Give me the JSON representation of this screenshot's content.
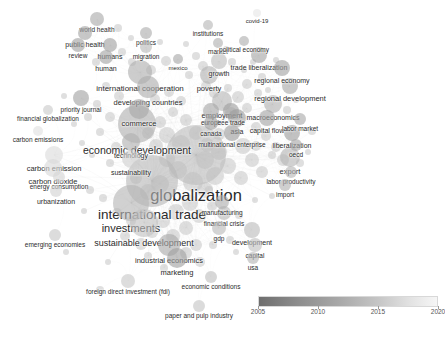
{
  "view": {
    "type": "bibliometric-network-map",
    "background": "#ffffff",
    "width": 445,
    "height": 337
  },
  "legend": {
    "name": "overlay-year-colorbar",
    "ticks": [
      "2005",
      "2010",
      "2015",
      "2020"
    ],
    "tick_positions": [
      0.0,
      0.333,
      0.666,
      1.0
    ],
    "gradient_from": "#6e6e6e",
    "gradient_to": "#f6f6f6"
  },
  "chart_data": {
    "type": "scatter",
    "title": "",
    "xlabel": "",
    "ylabel": "",
    "colorbar": {
      "label": "",
      "min": 2005,
      "max": 2020,
      "ticks": [
        2005,
        2010,
        2015,
        2020
      ]
    },
    "nodes": [
      {
        "label": "globalization",
        "x": 196,
        "y": 155,
        "size": 30,
        "fontsize": 16.5,
        "shade": "#bdbdbd",
        "year": 2013
      },
      {
        "label": "international trade",
        "x": 152,
        "y": 181,
        "size": 26,
        "fontsize": 13.5,
        "shade": "#b8b8b8",
        "year": 2012
      },
      {
        "label": "economic development",
        "x": 137,
        "y": 124,
        "size": 19,
        "fontsize": 10.5,
        "shade": "#b0b0b0",
        "year": 2011
      },
      {
        "label": "investments",
        "x": 131,
        "y": 203,
        "size": 18,
        "fontsize": 11.0,
        "shade": "#b4b4b4",
        "year": 2012
      },
      {
        "label": "sustainable development",
        "x": 144,
        "y": 223,
        "size": 14,
        "fontsize": 9.0,
        "shade": "#c2c2c2",
        "year": 2016
      },
      {
        "label": "international cooperation",
        "x": 140,
        "y": 72,
        "size": 12,
        "fontsize": 8.0,
        "shade": "#aeaeae",
        "year": 2010
      },
      {
        "label": "developing countries",
        "x": 148,
        "y": 87,
        "size": 11,
        "fontsize": 7.5,
        "shade": "#acacac",
        "year": 2010
      },
      {
        "label": "industrial economics",
        "x": 169,
        "y": 245,
        "size": 11,
        "fontsize": 7.5,
        "shade": "#a9a9a9",
        "year": 2009
      },
      {
        "label": "employment",
        "x": 222,
        "y": 101,
        "size": 10,
        "fontsize": 7.5,
        "shade": "#b6b6b6",
        "year": 2012
      },
      {
        "label": "commerce",
        "x": 139,
        "y": 109,
        "size": 10,
        "fontsize": 7.5,
        "shade": "#a8a8a8",
        "year": 2009
      },
      {
        "label": "export",
        "x": 290,
        "y": 157,
        "size": 10,
        "fontsize": 7.5,
        "shade": "#b5b5b5",
        "year": 2012
      },
      {
        "label": "marketing",
        "x": 177,
        "y": 258,
        "size": 10,
        "fontsize": 7.5,
        "shade": "#9f9f9f",
        "year": 2008
      },
      {
        "label": "asia",
        "x": 237,
        "y": 118,
        "size": 9,
        "fontsize": 7.0,
        "shade": "#9b9b9b",
        "year": 2008
      },
      {
        "label": "macroeconomics",
        "x": 273,
        "y": 104,
        "size": 9,
        "fontsize": 7.0,
        "shade": "#b2b2b2",
        "year": 2011
      },
      {
        "label": "carbon emission",
        "x": 54,
        "y": 155,
        "size": 9,
        "fontsize": 7.5,
        "shade": "#dcdcdc",
        "year": 2019
      },
      {
        "label": "carbon dioxide",
        "x": 53,
        "y": 168,
        "size": 9,
        "fontsize": 7.5,
        "shade": "#d8d8d8",
        "year": 2019
      },
      {
        "label": "technology",
        "x": 131,
        "y": 142,
        "size": 9,
        "fontsize": 7.0,
        "shade": "#b0b0b0",
        "year": 2011
      },
      {
        "label": "sustainability",
        "x": 131,
        "y": 159,
        "size": 9,
        "fontsize": 7.0,
        "shade": "#cfcfcf",
        "year": 2018
      },
      {
        "label": "poverty",
        "x": 209,
        "y": 75,
        "size": 9,
        "fontsize": 7.5,
        "shade": "#b2b2b2",
        "year": 2011
      },
      {
        "label": "growth",
        "x": 219,
        "y": 61,
        "size": 8,
        "fontsize": 7.0,
        "shade": "#bdbdbd",
        "year": 2013
      },
      {
        "label": "trade liberalization",
        "x": 259,
        "y": 55,
        "size": 8,
        "fontsize": 7.0,
        "shade": "#a5a5a5",
        "year": 2009
      },
      {
        "label": "regional development",
        "x": 290,
        "y": 86,
        "size": 8,
        "fontsize": 7.5,
        "shade": "#aaaaaa",
        "year": 2010
      },
      {
        "label": "regional economy",
        "x": 282,
        "y": 68,
        "size": 8,
        "fontsize": 7.0,
        "shade": "#a3a3a3",
        "year": 2009
      },
      {
        "label": "liberalization",
        "x": 292,
        "y": 133,
        "size": 8,
        "fontsize": 7.0,
        "shade": "#9d9d9d",
        "year": 2008
      },
      {
        "label": "multinational enterprise",
        "x": 232,
        "y": 133,
        "size": 8,
        "fontsize": 6.5,
        "shade": "#9c9c9c",
        "year": 2008
      },
      {
        "label": "capital flow",
        "x": 267,
        "y": 118,
        "size": 8,
        "fontsize": 7.0,
        "shade": "#a4a4a4",
        "year": 2009
      },
      {
        "label": "free trade",
        "x": 231,
        "y": 111,
        "size": 8,
        "fontsize": 6.5,
        "shade": "#9e9e9e",
        "year": 2008
      },
      {
        "label": "europe",
        "x": 211,
        "y": 111,
        "size": 8,
        "fontsize": 6.5,
        "shade": "#a6a6a6",
        "year": 2009
      },
      {
        "label": "canada",
        "x": 211,
        "y": 123,
        "size": 7,
        "fontsize": 6.5,
        "shade": "#9c9c9c",
        "year": 2008
      },
      {
        "label": "foreign direct investment (fdi)",
        "x": 128,
        "y": 281,
        "size": 7,
        "fontsize": 6.5,
        "shade": "#c8c8c8",
        "year": 2017
      },
      {
        "label": "development",
        "x": 252,
        "y": 230,
        "size": 8,
        "fontsize": 7.0,
        "shade": "#bbbbbb",
        "year": 2013
      },
      {
        "label": "financial crisis",
        "x": 224,
        "y": 213,
        "size": 7,
        "fontsize": 6.5,
        "shade": "#b7b7b7",
        "year": 2012
      },
      {
        "label": "manufacturing",
        "x": 222,
        "y": 202,
        "size": 7,
        "fontsize": 6.5,
        "shade": "#aeaeae",
        "year": 2010
      },
      {
        "label": "gdp",
        "x": 219,
        "y": 228,
        "size": 7,
        "fontsize": 6.5,
        "shade": "#bababa",
        "year": 2013
      },
      {
        "label": "capital",
        "x": 255,
        "y": 245,
        "size": 7,
        "fontsize": 6.5,
        "shade": "#c0c0c0",
        "year": 2014
      },
      {
        "label": "usa",
        "x": 253,
        "y": 258,
        "size": 6,
        "fontsize": 6.5,
        "shade": "#b4b4b4",
        "year": 2012
      },
      {
        "label": "economic conditions",
        "x": 211,
        "y": 277,
        "size": 6,
        "fontsize": 6.5,
        "shade": "#bfbfbf",
        "year": 2014
      },
      {
        "label": "paper and pulp industry",
        "x": 199,
        "y": 306,
        "size": 6,
        "fontsize": 6.5,
        "shade": "#c5c5c5",
        "year": 2015
      },
      {
        "label": "labor market",
        "x": 300,
        "y": 119,
        "size": 6,
        "fontsize": 6.5,
        "shade": "#a9a9a9",
        "year": 2010
      },
      {
        "label": "labor productivity",
        "x": 291,
        "y": 172,
        "size": 6,
        "fontsize": 6.5,
        "shade": "#b6b6b6",
        "year": 2012
      },
      {
        "label": "import",
        "x": 285,
        "y": 185,
        "size": 6,
        "fontsize": 6.5,
        "shade": "#b1b1b1",
        "year": 2011
      },
      {
        "label": "oecd",
        "x": 296,
        "y": 145,
        "size": 6,
        "fontsize": 6.5,
        "shade": "#a7a7a7",
        "year": 2009
      },
      {
        "label": "priority journal",
        "x": 81,
        "y": 98,
        "size": 8,
        "fontsize": 6.5,
        "shade": "#a2a2a2",
        "year": 2009
      },
      {
        "label": "financial globalization",
        "x": 48,
        "y": 110,
        "size": 5,
        "fontsize": 6.5,
        "shade": "#c9c9c9",
        "year": 2017
      },
      {
        "label": "carbon emissions",
        "x": 38,
        "y": 131,
        "size": 5,
        "fontsize": 6.5,
        "shade": "#e0e0e0",
        "year": 2020
      },
      {
        "label": "energy consumption",
        "x": 59,
        "y": 177,
        "size": 6,
        "fontsize": 6.5,
        "shade": "#d5d5d5",
        "year": 2019
      },
      {
        "label": "urbanization",
        "x": 56,
        "y": 191,
        "size": 6,
        "fontsize": 7.0,
        "shade": "#d2d2d2",
        "year": 2018
      },
      {
        "label": "emerging economies",
        "x": 55,
        "y": 235,
        "size": 6,
        "fontsize": 6.5,
        "shade": "#c6c6c6",
        "year": 2016
      },
      {
        "label": "world health",
        "x": 97,
        "y": 19,
        "size": 7,
        "fontsize": 6.5,
        "shade": "#a9a9a9",
        "year": 2010
      },
      {
        "label": "public health",
        "x": 85,
        "y": 33,
        "size": 7,
        "fontsize": 7.0,
        "shade": "#a5a5a5",
        "year": 2009
      },
      {
        "label": "review",
        "x": 78,
        "y": 45,
        "size": 7,
        "fontsize": 6.5,
        "shade": "#a1a1a1",
        "year": 2009
      },
      {
        "label": "humans",
        "x": 110,
        "y": 45,
        "size": 7,
        "fontsize": 7.0,
        "shade": "#a0a0a0",
        "year": 2008
      },
      {
        "label": "human",
        "x": 106,
        "y": 57,
        "size": 7,
        "fontsize": 7.0,
        "shade": "#a3a3a3",
        "year": 2009
      },
      {
        "label": "politics",
        "x": 146,
        "y": 33,
        "size": 6,
        "fontsize": 6.5,
        "shade": "#acacac",
        "year": 2010
      },
      {
        "label": "migration",
        "x": 146,
        "y": 47,
        "size": 6,
        "fontsize": 6.5,
        "shade": "#b9b9b9",
        "year": 2013
      },
      {
        "label": "mexico",
        "x": 178,
        "y": 59,
        "size": 5,
        "fontsize": 6.0,
        "shade": "#a8a8a8",
        "year": 2009
      },
      {
        "label": "institutions",
        "x": 208,
        "y": 25,
        "size": 5,
        "fontsize": 6.5,
        "shade": "#b6b6b6",
        "year": 2012
      },
      {
        "label": "market",
        "x": 218,
        "y": 43,
        "size": 5,
        "fontsize": 6.5,
        "shade": "#b0b0b0",
        "year": 2011
      },
      {
        "label": "political economy",
        "x": 244,
        "y": 41,
        "size": 5,
        "fontsize": 6.5,
        "shade": "#aeaeae",
        "year": 2011
      },
      {
        "label": "covid-19",
        "x": 257,
        "y": 13,
        "size": 4,
        "fontsize": 6.0,
        "shade": "#e6e6e6",
        "year": 2020
      }
    ],
    "unlabeled_nodes": [
      {
        "x": 118,
        "y": 28,
        "size": 4
      },
      {
        "x": 131,
        "y": 38,
        "size": 3
      },
      {
        "x": 122,
        "y": 52,
        "size": 4
      },
      {
        "x": 96,
        "y": 62,
        "size": 4
      },
      {
        "x": 160,
        "y": 42,
        "size": 3
      },
      {
        "x": 166,
        "y": 61,
        "size": 5
      },
      {
        "x": 186,
        "y": 44,
        "size": 3
      },
      {
        "x": 196,
        "y": 56,
        "size": 4
      },
      {
        "x": 203,
        "y": 66,
        "size": 5
      },
      {
        "x": 226,
        "y": 49,
        "size": 3
      },
      {
        "x": 232,
        "y": 62,
        "size": 4
      },
      {
        "x": 244,
        "y": 70,
        "size": 3
      },
      {
        "x": 253,
        "y": 62,
        "size": 3
      },
      {
        "x": 262,
        "y": 77,
        "size": 4
      },
      {
        "x": 276,
        "y": 60,
        "size": 3
      },
      {
        "x": 247,
        "y": 84,
        "size": 5
      },
      {
        "x": 258,
        "y": 93,
        "size": 4
      },
      {
        "x": 268,
        "y": 90,
        "size": 3
      },
      {
        "x": 206,
        "y": 86,
        "size": 5
      },
      {
        "x": 214,
        "y": 93,
        "size": 5
      },
      {
        "x": 228,
        "y": 88,
        "size": 4
      },
      {
        "x": 238,
        "y": 97,
        "size": 6
      },
      {
        "x": 247,
        "y": 108,
        "size": 5
      },
      {
        "x": 256,
        "y": 127,
        "size": 5
      },
      {
        "x": 266,
        "y": 136,
        "size": 5
      },
      {
        "x": 276,
        "y": 147,
        "size": 5
      },
      {
        "x": 283,
        "y": 160,
        "size": 6
      },
      {
        "x": 300,
        "y": 163,
        "size": 4
      },
      {
        "x": 308,
        "y": 152,
        "size": 3
      },
      {
        "x": 312,
        "y": 131,
        "size": 4
      },
      {
        "x": 287,
        "y": 110,
        "size": 4
      },
      {
        "x": 296,
        "y": 100,
        "size": 3
      },
      {
        "x": 243,
        "y": 146,
        "size": 8
      },
      {
        "x": 252,
        "y": 160,
        "size": 7
      },
      {
        "x": 262,
        "y": 172,
        "size": 6
      },
      {
        "x": 241,
        "y": 178,
        "size": 7
      },
      {
        "x": 228,
        "y": 166,
        "size": 8
      },
      {
        "x": 215,
        "y": 176,
        "size": 9
      },
      {
        "x": 205,
        "y": 190,
        "size": 8
      },
      {
        "x": 193,
        "y": 182,
        "size": 10
      },
      {
        "x": 178,
        "y": 170,
        "size": 9
      },
      {
        "x": 167,
        "y": 159,
        "size": 8
      },
      {
        "x": 156,
        "y": 146,
        "size": 7
      },
      {
        "x": 148,
        "y": 133,
        "size": 6
      },
      {
        "x": 167,
        "y": 135,
        "size": 8
      },
      {
        "x": 181,
        "y": 144,
        "size": 9
      },
      {
        "x": 196,
        "y": 133,
        "size": 7
      },
      {
        "x": 207,
        "y": 145,
        "size": 7
      },
      {
        "x": 219,
        "y": 134,
        "size": 6
      },
      {
        "x": 186,
        "y": 120,
        "size": 6
      },
      {
        "x": 173,
        "y": 112,
        "size": 5
      },
      {
        "x": 160,
        "y": 122,
        "size": 6
      },
      {
        "x": 119,
        "y": 96,
        "size": 5
      },
      {
        "x": 106,
        "y": 86,
        "size": 4
      },
      {
        "x": 97,
        "y": 104,
        "size": 4
      },
      {
        "x": 110,
        "y": 117,
        "size": 5
      },
      {
        "x": 100,
        "y": 132,
        "size": 4
      },
      {
        "x": 116,
        "y": 147,
        "size": 5
      },
      {
        "x": 110,
        "y": 163,
        "size": 4
      },
      {
        "x": 92,
        "y": 155,
        "size": 3
      },
      {
        "x": 82,
        "y": 143,
        "size": 3
      },
      {
        "x": 74,
        "y": 124,
        "size": 3
      },
      {
        "x": 90,
        "y": 190,
        "size": 4
      },
      {
        "x": 103,
        "y": 198,
        "size": 4
      },
      {
        "x": 117,
        "y": 213,
        "size": 5
      },
      {
        "x": 131,
        "y": 221,
        "size": 5
      },
      {
        "x": 125,
        "y": 236,
        "size": 5
      },
      {
        "x": 141,
        "y": 244,
        "size": 6
      },
      {
        "x": 152,
        "y": 232,
        "size": 6
      },
      {
        "x": 163,
        "y": 221,
        "size": 7
      },
      {
        "x": 176,
        "y": 212,
        "size": 8
      },
      {
        "x": 190,
        "y": 203,
        "size": 8
      },
      {
        "x": 199,
        "y": 216,
        "size": 7
      },
      {
        "x": 186,
        "y": 228,
        "size": 7
      },
      {
        "x": 173,
        "y": 236,
        "size": 7
      },
      {
        "x": 196,
        "y": 245,
        "size": 6
      },
      {
        "x": 186,
        "y": 253,
        "size": 6
      },
      {
        "x": 200,
        "y": 262,
        "size": 5
      },
      {
        "x": 164,
        "y": 268,
        "size": 4
      },
      {
        "x": 148,
        "y": 256,
        "size": 4
      },
      {
        "x": 108,
        "y": 262,
        "size": 3
      },
      {
        "x": 100,
        "y": 290,
        "size": 4
      },
      {
        "x": 213,
        "y": 245,
        "size": 4
      },
      {
        "x": 230,
        "y": 240,
        "size": 4
      },
      {
        "x": 239,
        "y": 215,
        "size": 4
      },
      {
        "x": 236,
        "y": 252,
        "size": 3
      },
      {
        "x": 209,
        "y": 190,
        "size": 4
      },
      {
        "x": 255,
        "y": 200,
        "size": 3
      },
      {
        "x": 272,
        "y": 196,
        "size": 3
      },
      {
        "x": 84,
        "y": 211,
        "size": 3
      },
      {
        "x": 66,
        "y": 252,
        "size": 3
      },
      {
        "x": 88,
        "y": 117,
        "size": 4
      },
      {
        "x": 64,
        "y": 96,
        "size": 3
      },
      {
        "x": 155,
        "y": 99,
        "size": 5
      },
      {
        "x": 169,
        "y": 92,
        "size": 5
      },
      {
        "x": 181,
        "y": 101,
        "size": 5
      },
      {
        "x": 132,
        "y": 62,
        "size": 4
      },
      {
        "x": 151,
        "y": 70,
        "size": 5
      },
      {
        "x": 189,
        "y": 75,
        "size": 4
      },
      {
        "x": 272,
        "y": 155,
        "size": 4
      },
      {
        "x": 148,
        "y": 192,
        "size": 8
      },
      {
        "x": 160,
        "y": 184,
        "size": 9
      },
      {
        "x": 136,
        "y": 178,
        "size": 6
      },
      {
        "x": 205,
        "y": 160,
        "size": 9
      },
      {
        "x": 219,
        "y": 152,
        "size": 8
      },
      {
        "x": 231,
        "y": 113,
        "size": 6
      },
      {
        "x": 256,
        "y": 146,
        "size": 5
      },
      {
        "x": 212,
        "y": 206,
        "size": 5
      }
    ]
  }
}
